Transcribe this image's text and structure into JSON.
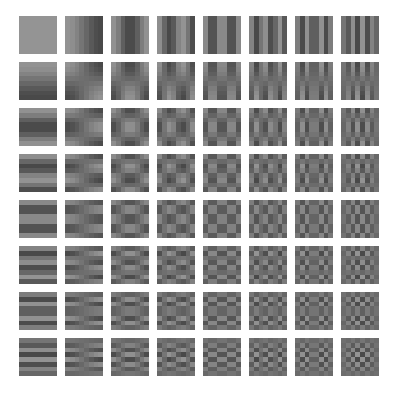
{
  "figure": {
    "kind": "dct-basis-grid",
    "width": 402,
    "height": 412,
    "background_color": "#ffffff"
  },
  "grid": {
    "rows": 8,
    "columns": 8,
    "origin_x": 19,
    "origin_y": 16,
    "tile_size": 38,
    "gap": 8,
    "pitch": 46,
    "row_axis_meaning": "vertical frequency v increases downward",
    "column_axis_meaning": "horizontal frequency u increases rightward"
  },
  "chart_data": {
    "type": "heatmap",
    "title": "",
    "subtitle": "",
    "xlabel": "",
    "ylabel": "",
    "legend_position": "none",
    "grid": false,
    "tiles_rows": 8,
    "tiles_cols": 8,
    "block_size": 8,
    "formula": "B[v][u](i,j) = cos((2*j+1)*u*PI/16) * cos((2*i+1)*v*PI/16)",
    "gray_mid": 110,
    "gray_amplitude": 38,
    "gray_min_hex": "#4a4a4a",
    "gray_mid_hex": "#6e6e6e",
    "gray_max_hex": "#949494",
    "u_values": [
      0,
      1,
      2,
      3,
      4,
      5,
      6,
      7
    ],
    "v_values": [
      0,
      1,
      2,
      3,
      4,
      5,
      6,
      7
    ],
    "x": [
      0,
      1,
      2,
      3,
      4,
      5,
      6,
      7
    ],
    "tick_labels_x": [
      "0",
      "1",
      "2",
      "3",
      "4",
      "5",
      "6",
      "7"
    ],
    "tick_labels_y": [
      "0",
      "1",
      "2",
      "3",
      "4",
      "5",
      "6",
      "7"
    ],
    "xlim": [
      0,
      7
    ],
    "ylim": [
      0,
      7
    ],
    "series": [
      {
        "name": "v=0",
        "values": [
          0,
          1,
          2,
          3,
          4,
          5,
          6,
          7
        ]
      },
      {
        "name": "v=1",
        "values": [
          0,
          1,
          2,
          3,
          4,
          5,
          6,
          7
        ]
      },
      {
        "name": "v=2",
        "values": [
          0,
          1,
          2,
          3,
          4,
          5,
          6,
          7
        ]
      },
      {
        "name": "v=3",
        "values": [
          0,
          1,
          2,
          3,
          4,
          5,
          6,
          7
        ]
      },
      {
        "name": "v=4",
        "values": [
          0,
          1,
          2,
          3,
          4,
          5,
          6,
          7
        ]
      },
      {
        "name": "v=5",
        "values": [
          0,
          1,
          2,
          3,
          4,
          5,
          6,
          7
        ]
      },
      {
        "name": "v=6",
        "values": [
          0,
          1,
          2,
          3,
          4,
          5,
          6,
          7
        ]
      },
      {
        "name": "v=7",
        "values": [
          0,
          1,
          2,
          3,
          4,
          5,
          6,
          7
        ]
      }
    ]
  }
}
